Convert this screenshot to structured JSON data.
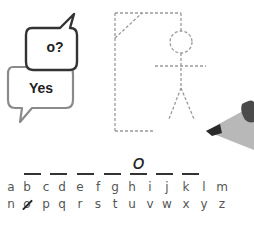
{
  "bubbles": {
    "question": "o?",
    "answer": "Yes"
  },
  "word": {
    "length": 7,
    "slots": [
      "",
      "",
      "",
      "",
      "o",
      "",
      ""
    ]
  },
  "alphabet": {
    "row1": [
      "a",
      "b",
      "c",
      "d",
      "e",
      "f",
      "g",
      "h",
      "i",
      "j",
      "k",
      "l",
      "m"
    ],
    "row2": [
      "n",
      "o",
      "p",
      "q",
      "r",
      "s",
      "t",
      "u",
      "v",
      "w",
      "x",
      "y",
      "z"
    ],
    "guessed": [
      "o"
    ]
  },
  "colors": {
    "dashed_line": "#9a9a9a",
    "bubble_dark": "#333333",
    "bubble_light": "#8a8a8a",
    "pencil_body": "#b5b5b5",
    "pencil_tip": "#2a2a2a"
  }
}
